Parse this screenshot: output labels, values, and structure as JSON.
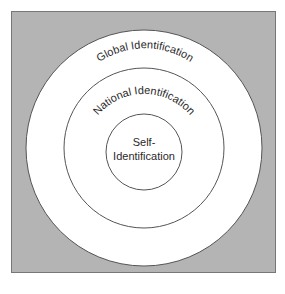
{
  "diagram": {
    "type": "concentric-circles",
    "background_color": "#b4b4b4",
    "circle_fill": "#ffffff",
    "stroke_color": "#555555",
    "rings": [
      {
        "label": "Global Identification",
        "level": "outer"
      },
      {
        "label": "National Identification",
        "level": "middle"
      },
      {
        "label_line1": "Self-",
        "label_line2": "Identification",
        "level": "inner"
      }
    ]
  }
}
